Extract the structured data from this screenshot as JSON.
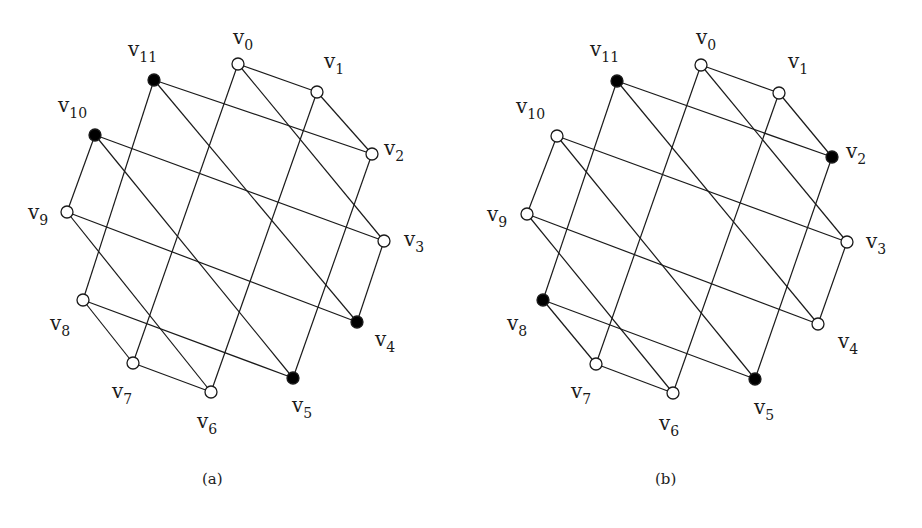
{
  "figure": {
    "edges": [
      [
        0,
        1
      ],
      [
        1,
        2
      ],
      [
        0,
        7
      ],
      [
        0,
        3
      ],
      [
        1,
        6
      ],
      [
        2,
        11
      ],
      [
        2,
        5
      ],
      [
        3,
        10
      ],
      [
        3,
        4
      ],
      [
        4,
        11
      ],
      [
        4,
        9
      ],
      [
        5,
        10
      ],
      [
        5,
        8
      ],
      [
        6,
        7
      ],
      [
        6,
        9
      ],
      [
        7,
        8
      ],
      [
        8,
        11
      ],
      [
        9,
        10
      ]
    ],
    "colors": {
      "stroke": "#1a1a1a",
      "filled": "#000000",
      "empty": "#ffffff"
    },
    "panels": [
      {
        "id": "a",
        "caption": "(a)",
        "caption_pos": [
          212,
          482
        ],
        "nodes": [
          {
            "name": "v",
            "sub": "0",
            "x": 238,
            "y": 64,
            "filled": false,
            "lx": 233,
            "ly": 44
          },
          {
            "name": "v",
            "sub": "1",
            "x": 317,
            "y": 92,
            "filled": false,
            "lx": 324,
            "ly": 68
          },
          {
            "name": "v",
            "sub": "2",
            "x": 372,
            "y": 154,
            "filled": false,
            "lx": 384,
            "ly": 155
          },
          {
            "name": "v",
            "sub": "3",
            "x": 384,
            "y": 241,
            "filled": false,
            "lx": 404,
            "ly": 246
          },
          {
            "name": "v",
            "sub": "4",
            "x": 357,
            "y": 322,
            "filled": true,
            "lx": 375,
            "ly": 346
          },
          {
            "name": "v",
            "sub": "5",
            "x": 293,
            "y": 378,
            "filled": true,
            "lx": 292,
            "ly": 412
          },
          {
            "name": "v",
            "sub": "6",
            "x": 211,
            "y": 392,
            "filled": false,
            "lx": 197,
            "ly": 428
          },
          {
            "name": "v",
            "sub": "7",
            "x": 133,
            "y": 363,
            "filled": false,
            "lx": 112,
            "ly": 398
          },
          {
            "name": "v",
            "sub": "8",
            "x": 83,
            "y": 300,
            "filled": false,
            "lx": 50,
            "ly": 330
          },
          {
            "name": "v",
            "sub": "9",
            "x": 67,
            "y": 212,
            "filled": false,
            "lx": 28,
            "ly": 219
          },
          {
            "name": "v",
            "sub": "10",
            "x": 95,
            "y": 135,
            "filled": true,
            "lx": 58,
            "ly": 112
          },
          {
            "name": "v",
            "sub": "11",
            "x": 154,
            "y": 80,
            "filled": true,
            "lx": 128,
            "ly": 56
          }
        ]
      },
      {
        "id": "b",
        "caption": "(b)",
        "caption_pos": [
          665,
          482
        ],
        "nodes": [
          {
            "name": "v",
            "sub": "0",
            "x": 701,
            "y": 65,
            "filled": false,
            "lx": 696,
            "ly": 44
          },
          {
            "name": "v",
            "sub": "1",
            "x": 779,
            "y": 93,
            "filled": false,
            "lx": 788,
            "ly": 68
          },
          {
            "name": "v",
            "sub": "2",
            "x": 832,
            "y": 157,
            "filled": true,
            "lx": 846,
            "ly": 158
          },
          {
            "name": "v",
            "sub": "3",
            "x": 847,
            "y": 242,
            "filled": false,
            "lx": 866,
            "ly": 248
          },
          {
            "name": "v",
            "sub": "4",
            "x": 818,
            "y": 324,
            "filled": false,
            "lx": 838,
            "ly": 348
          },
          {
            "name": "v",
            "sub": "5",
            "x": 755,
            "y": 379,
            "filled": true,
            "lx": 754,
            "ly": 414
          },
          {
            "name": "v",
            "sub": "6",
            "x": 673,
            "y": 393,
            "filled": false,
            "lx": 659,
            "ly": 430
          },
          {
            "name": "v",
            "sub": "7",
            "x": 596,
            "y": 364,
            "filled": false,
            "lx": 571,
            "ly": 398
          },
          {
            "name": "v",
            "sub": "8",
            "x": 543,
            "y": 300,
            "filled": true,
            "lx": 507,
            "ly": 330
          },
          {
            "name": "v",
            "sub": "9",
            "x": 527,
            "y": 214,
            "filled": false,
            "lx": 487,
            "ly": 221
          },
          {
            "name": "v",
            "sub": "10",
            "x": 557,
            "y": 136,
            "filled": false,
            "lx": 516,
            "ly": 113
          },
          {
            "name": "v",
            "sub": "11",
            "x": 617,
            "y": 81,
            "filled": true,
            "lx": 590,
            "ly": 56
          }
        ]
      }
    ]
  }
}
